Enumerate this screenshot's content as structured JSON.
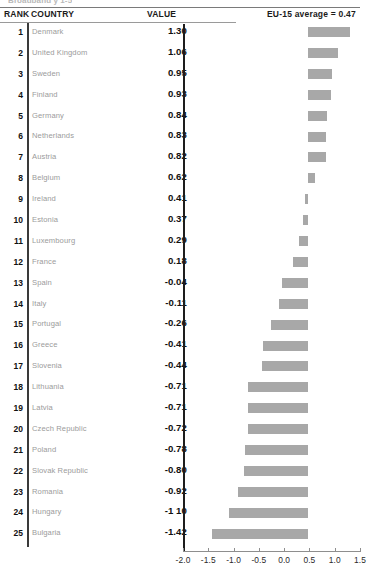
{
  "caption": {
    "clipped_title": "Broadband y 1-5"
  },
  "header": {
    "rank": "RANK",
    "country": "COUNTRY",
    "value": "VALUE",
    "note": "EU-15 average = 0.47"
  },
  "chart_data": {
    "type": "bar",
    "title": "EU-15 average = 0.47",
    "orientation": "horizontal",
    "xlabel": "",
    "ylabel": "",
    "xlim": [
      -2.0,
      1.5
    ],
    "xticks": [
      "-2.0",
      "-1.5",
      "-1.0",
      "-0.5",
      "0.0",
      "0.5",
      "1.0",
      "1.5"
    ],
    "xtick_values": [
      -2.0,
      -1.5,
      -1.0,
      -0.5,
      0.0,
      0.5,
      1.0,
      1.5
    ],
    "grid": false,
    "legend": false,
    "reference_line": 0.47,
    "reference_line_label": "EU-15 average = 0.47",
    "bar_color": "#a8a8a8",
    "bars_anchored_at": 0.47,
    "categories": [
      "Denmark",
      "United Kingdom",
      "Sweden",
      "Finland",
      "Germany",
      "Netherlands",
      "Austria",
      "Belgium",
      "Ireland",
      "Estonia",
      "Luxembourg",
      "France",
      "Spain",
      "Italy",
      "Portugal",
      "Greece",
      "Slovenia",
      "Lithuania",
      "Latvia",
      "Czech Republic",
      "Poland",
      "Slovak Republic",
      "Romania",
      "Hungary",
      "Bulgaria"
    ],
    "values": [
      1.3,
      1.06,
      0.95,
      0.93,
      0.84,
      0.83,
      0.82,
      0.62,
      0.41,
      0.37,
      0.29,
      0.18,
      -0.04,
      -0.11,
      -0.26,
      -0.41,
      -0.44,
      -0.71,
      -0.71,
      -0.72,
      -0.78,
      -0.8,
      -0.92,
      -1.1,
      -1.42
    ]
  },
  "rows": [
    {
      "rank": "1",
      "country": "Denmark",
      "value": "1.30",
      "num": 1.3
    },
    {
      "rank": "2",
      "country": "United Kingdom",
      "value": "1.06",
      "num": 1.06
    },
    {
      "rank": "3",
      "country": "Sweden",
      "value": "0.95",
      "num": 0.95
    },
    {
      "rank": "4",
      "country": "Finland",
      "value": "0.93",
      "num": 0.93
    },
    {
      "rank": "5",
      "country": "Germany",
      "value": "0.84",
      "num": 0.84
    },
    {
      "rank": "6",
      "country": "Netherlands",
      "value": "0.83",
      "num": 0.83
    },
    {
      "rank": "7",
      "country": "Austria",
      "value": "0.82",
      "num": 0.82
    },
    {
      "rank": "8",
      "country": "Belgium",
      "value": "0.62",
      "num": 0.62
    },
    {
      "rank": "9",
      "country": "Ireland",
      "value": "0.41",
      "num": 0.41
    },
    {
      "rank": "10",
      "country": "Estonia",
      "value": "0.37",
      "num": 0.37
    },
    {
      "rank": "11",
      "country": "Luxembourg",
      "value": "0.29",
      "num": 0.29
    },
    {
      "rank": "12",
      "country": "France",
      "value": "0.18",
      "num": 0.18
    },
    {
      "rank": "13",
      "country": "Spain",
      "value": "-0.04",
      "num": -0.04
    },
    {
      "rank": "14",
      "country": "Italy",
      "value": "-0.11",
      "num": -0.11
    },
    {
      "rank": "15",
      "country": "Portugal",
      "value": "-0.26",
      "num": -0.26
    },
    {
      "rank": "16",
      "country": "Greece",
      "value": "-0.41",
      "num": -0.41
    },
    {
      "rank": "17",
      "country": "Slovenia",
      "value": "-0.44",
      "num": -0.44
    },
    {
      "rank": "18",
      "country": "Lithuania",
      "value": "-0.71",
      "num": -0.71
    },
    {
      "rank": "19",
      "country": "Latvia",
      "value": "-0.71",
      "num": -0.71
    },
    {
      "rank": "20",
      "country": "Czech Republic",
      "value": "-0.72",
      "num": -0.72
    },
    {
      "rank": "21",
      "country": "Poland",
      "value": "-0.78",
      "num": -0.78
    },
    {
      "rank": "22",
      "country": "Slovak Republic",
      "value": "-0.80",
      "num": -0.8
    },
    {
      "rank": "23",
      "country": "Romania",
      "value": "-0.92",
      "num": -0.92
    },
    {
      "rank": "24",
      "country": "Hungary",
      "value": "-1 10",
      "num": -1.1
    },
    {
      "rank": "25",
      "country": "Bulgaria",
      "value": "-1.42",
      "num": -1.42
    }
  ]
}
